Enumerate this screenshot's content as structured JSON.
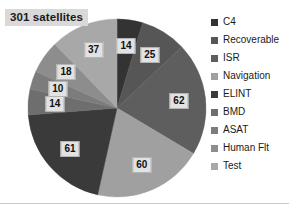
{
  "chart_data": {
    "type": "pie",
    "title": "301 satellites",
    "total": 301,
    "categories": [
      "C4",
      "Recoverable",
      "ISR",
      "Navigation",
      "ELINT",
      "BMD",
      "ASAT",
      "Human Flt",
      "Test"
    ],
    "values": [
      14,
      25,
      62,
      60,
      61,
      14,
      10,
      18,
      37
    ],
    "colors": [
      "#333333",
      "#565656",
      "#5e5e5e",
      "#a0a0a0",
      "#3a3a3a",
      "#6e6e6e",
      "#7c7c7c",
      "#8d8d8d",
      "#a8a8a8"
    ],
    "data_labels": [
      "14",
      "25",
      "62",
      "60",
      "61",
      "14",
      "10",
      "18",
      "37"
    ],
    "start_angle_deg": 0,
    "direction": "clockwise",
    "legend_position": "right",
    "grid": false,
    "xlabel": "",
    "ylabel": ""
  },
  "legend": {
    "items": [
      {
        "label": "C4",
        "color": "#333333"
      },
      {
        "label": "Recoverable",
        "color": "#565656"
      },
      {
        "label": "ISR",
        "color": "#5e5e5e"
      },
      {
        "label": "Navigation",
        "color": "#a0a0a0"
      },
      {
        "label": "ELINT",
        "color": "#3a3a3a"
      },
      {
        "label": "BMD",
        "color": "#6e6e6e"
      },
      {
        "label": "ASAT",
        "color": "#7c7c7c"
      },
      {
        "label": "Human Flt",
        "color": "#8d8d8d"
      },
      {
        "label": "Test",
        "color": "#a8a8a8"
      }
    ]
  }
}
